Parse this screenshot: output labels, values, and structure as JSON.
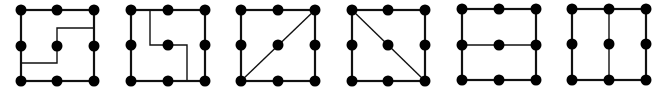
{
  "diagram": {
    "colors": {
      "line": "#111111",
      "dot": "#000000",
      "background": "#ffffff"
    },
    "dot_radius": 5.5,
    "outer_stroke": 2.2,
    "inner_stroke": 1.4,
    "figures": [
      {
        "id": "figure-1",
        "xs": [
          21,
          57,
          94
        ],
        "ys": [
          10,
          46,
          81
        ],
        "divider": [
          [
            21,
            63
          ],
          [
            57,
            63
          ],
          [
            57,
            28
          ],
          [
            94,
            28
          ]
        ]
      },
      {
        "id": "figure-2",
        "xs": [
          131,
          168,
          205
        ],
        "ys": [
          10,
          45,
          81
        ],
        "divider": [
          [
            150,
            10
          ],
          [
            150,
            45
          ],
          [
            187,
            45
          ],
          [
            187,
            81
          ]
        ]
      },
      {
        "id": "figure-3",
        "xs": [
          241,
          278,
          315
        ],
        "ys": [
          10,
          45,
          81
        ],
        "divider": [
          [
            241,
            81
          ],
          [
            315,
            10
          ]
        ]
      },
      {
        "id": "figure-4",
        "xs": [
          352,
          388,
          425
        ],
        "ys": [
          10,
          45,
          81
        ],
        "divider": [
          [
            352,
            10
          ],
          [
            425,
            81
          ]
        ]
      },
      {
        "id": "figure-5",
        "xs": [
          462,
          499,
          536
        ],
        "ys": [
          9,
          45,
          80
        ],
        "divider": [
          [
            462,
            45
          ],
          [
            536,
            45
          ]
        ]
      },
      {
        "id": "figure-6",
        "xs": [
          572,
          609,
          646
        ],
        "ys": [
          9,
          44,
          80
        ],
        "divider": [
          [
            609,
            9
          ],
          [
            609,
            80
          ]
        ]
      }
    ]
  }
}
